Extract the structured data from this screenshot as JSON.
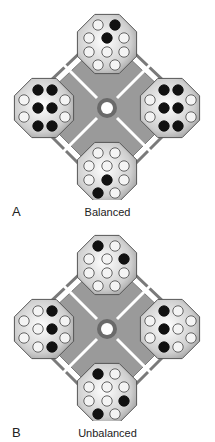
{
  "panels": [
    {
      "letter": "A",
      "caption": "Balanced",
      "buckets": {
        "top": [
          0,
          1,
          0,
          1,
          0,
          0,
          0,
          0,
          0,
          0
        ],
        "left": [
          0,
          0,
          1,
          1,
          1,
          1,
          1,
          1,
          0,
          0
        ],
        "right": [
          0,
          0,
          1,
          1,
          1,
          1,
          1,
          1,
          0,
          0
        ],
        "bottom": [
          0,
          0,
          0,
          0,
          0,
          0,
          1,
          0,
          1,
          0
        ]
      }
    },
    {
      "letter": "B",
      "caption": "Unbalanced",
      "buckets": {
        "top": [
          1,
          0,
          0,
          0,
          1,
          0,
          0,
          0,
          0,
          0
        ],
        "left": [
          0,
          0,
          0,
          0,
          0,
          1,
          1,
          1,
          0,
          0
        ],
        "right": [
          0,
          0,
          1,
          1,
          1,
          0,
          0,
          0,
          0,
          0
        ],
        "bottom": [
          1,
          0,
          0,
          0,
          0,
          0,
          0,
          1,
          1,
          0
        ]
      }
    }
  ],
  "colors": {
    "frame_fill": "#9a9a9a",
    "frame_outline": "#7a7a7a",
    "arm_line": "#ffffff",
    "hub_ring": "#6a6a6a",
    "bucket_edge": "#555555",
    "tube_filled": "#111111",
    "tube_empty_stroke": "#555555"
  }
}
